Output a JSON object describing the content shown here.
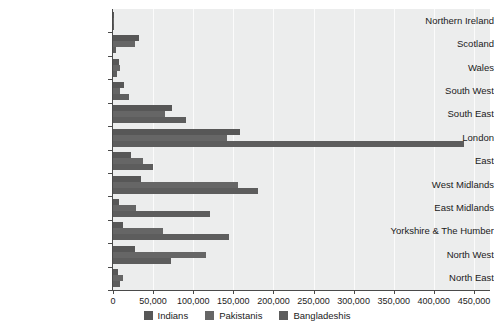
{
  "chart_data": {
    "type": "bar",
    "orientation": "horizontal",
    "title": "",
    "subtitle": "",
    "xlabel": "",
    "ylabel": "",
    "xlim": [
      0,
      470000
    ],
    "xticks": [
      0,
      50000,
      100000,
      150000,
      200000,
      250000,
      300000,
      350000,
      400000,
      450000
    ],
    "xtick_labels": [
      "0",
      "50,000",
      "100,000",
      "150,000",
      "200,000",
      "250,000",
      "300,000",
      "350,000",
      "400,000",
      "450,000"
    ],
    "grid": true,
    "grid_axis": "x",
    "legend_position": "bottom",
    "categories": [
      "Northern Ireland",
      "Scotland",
      "Wales",
      "South West",
      "South East",
      "London",
      "East",
      "West Midlands",
      "East Midlands",
      "Yorkshire & The Humber",
      "North West",
      "North East"
    ],
    "series": [
      {
        "name": "Indians",
        "color": "#575757",
        "values": [
          1500,
          32000,
          8000,
          14000,
          73000,
          158000,
          22000,
          35000,
          8000,
          12000,
          27000,
          6000
        ]
      },
      {
        "name": "Pakistanis",
        "color": "#666666",
        "values": [
          1000,
          28000,
          9000,
          9000,
          65000,
          142000,
          37000,
          156000,
          29000,
          62000,
          116000,
          13000
        ]
      },
      {
        "name": "Bangladeshis",
        "color": "#5d5d5d",
        "values": [
          600,
          4000,
          5000,
          20000,
          91000,
          438000,
          50000,
          181000,
          121000,
          145000,
          72000,
          9000
        ]
      }
    ],
    "legend": [
      {
        "label": "Indians",
        "color": "#575757"
      },
      {
        "label": "Pakistanis",
        "color": "#666666"
      },
      {
        "label": "Bangladeshis",
        "color": "#5d5d5d"
      }
    ],
    "colors": {
      "plot_background": "#eceded",
      "gridline": "#fbfbfb",
      "axis": "#4a4a4a",
      "text": "#1b1b1b",
      "page_background": "#ffffff"
    }
  }
}
